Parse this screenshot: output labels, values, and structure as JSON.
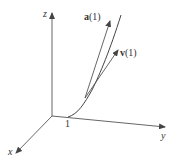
{
  "diagram": {
    "type": "3d-space-curve",
    "axes": {
      "x": {
        "label": "x"
      },
      "y": {
        "label": "y"
      },
      "z": {
        "label": "z"
      }
    },
    "point_label": "1",
    "vectors": [
      {
        "name": "acceleration",
        "label_bold": "a",
        "label_arg": "(1)"
      },
      {
        "name": "velocity",
        "label_bold": "v",
        "label_arg": "(1)"
      }
    ],
    "colors": {
      "stroke": "#555555",
      "text": "#333333"
    }
  }
}
